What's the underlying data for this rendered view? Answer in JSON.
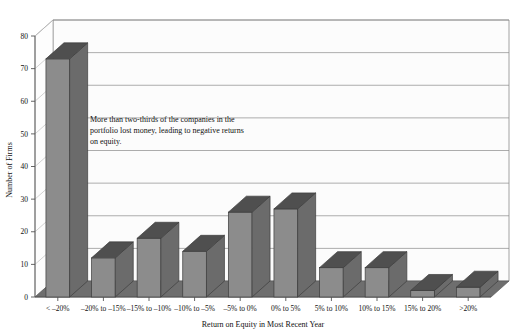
{
  "chart_data": {
    "type": "bar",
    "title": "",
    "xlabel": "Return on Equity in Most Recent Year",
    "ylabel": "Number of Firms",
    "ylim": [
      0,
      80
    ],
    "yticks": [
      0,
      10,
      20,
      30,
      40,
      50,
      60,
      70,
      80
    ],
    "grid": true,
    "legend": false,
    "style": "3d-bars",
    "categories": [
      "< –20%",
      "–20% to –15%",
      "–15% to –10%",
      "–10% to –5%",
      "–5% to 0%",
      "0% to 5%",
      "5% to 10%",
      "10% to 15%",
      "15% to 20%",
      ">20%"
    ],
    "values": [
      73,
      12,
      18,
      14,
      26,
      27,
      9,
      9,
      2,
      3
    ],
    "annotations": [
      {
        "id": "portfolio-note",
        "lines": [
          "More than two-thirds of the companies in the",
          "portfolio lost money, leading to negative returns",
          "on equity."
        ]
      }
    ],
    "colors": {
      "bar_face": "#8c8c8c",
      "bar_side": "#6b6b6b",
      "bar_top": "#4f4f4f",
      "floor": "#6e6e6e",
      "wall": "#fcfcfc",
      "gridline": "#8a8a8a",
      "axis": "#555555",
      "background": "#ffffff"
    }
  }
}
